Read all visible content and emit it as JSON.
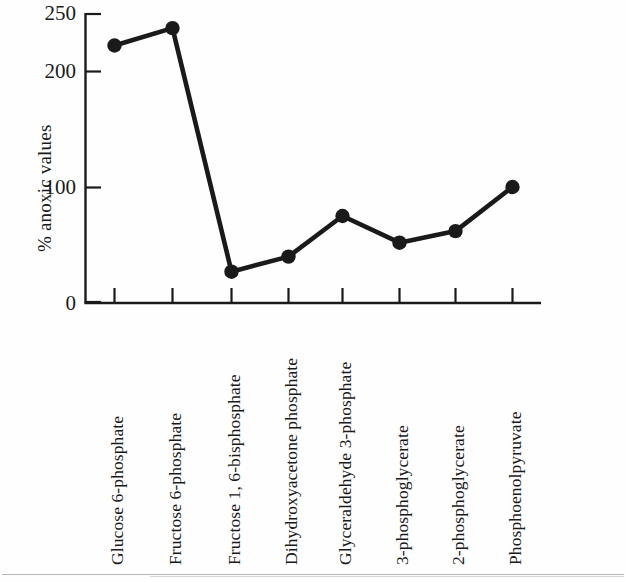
{
  "chart_data": {
    "type": "line",
    "title": "",
    "xlabel": "",
    "ylabel": "% anoxic values",
    "ylim": [
      0,
      250
    ],
    "yticks": [
      0,
      100,
      200,
      250
    ],
    "ytick_labels": [
      "0",
      "100",
      "200",
      "250"
    ],
    "grid": false,
    "legend": "none",
    "marker": "filled-circle",
    "categories": [
      "Glucose 6-phosphate",
      "Fructose 6-phosphate",
      "Fructose 1, 6-bisphosphate",
      "Dihydroxyacetone phosphate",
      "Glyceraldehyde 3-phosphate",
      "3-phosphoglycerate",
      "2-phosphoglycerate",
      "Phosphoenolpyruvate"
    ],
    "values": [
      222,
      237,
      27,
      40,
      75,
      52,
      62,
      100
    ],
    "series": [
      {
        "name": "% anoxic values",
        "values": [
          222,
          237,
          27,
          40,
          75,
          52,
          62,
          100
        ]
      }
    ],
    "colors": {
      "line": "#1a1a1a",
      "marker": "#1a1a1a",
      "axis": "#1a1a1a",
      "background": "#fefefe"
    }
  },
  "axis": {
    "y_title": "% anoxic values",
    "y_tick_0": "0",
    "y_tick_100": "100",
    "y_tick_200": "200",
    "y_tick_250": "250"
  },
  "x_categories": {
    "c0": "Glucose 6-phosphate",
    "c1": "Fructose 6-phosphate",
    "c2": "Fructose 1, 6-bisphosphate",
    "c3": "Dihydroxyacetone phosphate",
    "c4": "Glyceraldehyde 3-phosphate",
    "c5": "3-phosphoglycerate",
    "c6": "2-phosphoglycerate",
    "c7": "Phosphoenolpyruvate"
  }
}
